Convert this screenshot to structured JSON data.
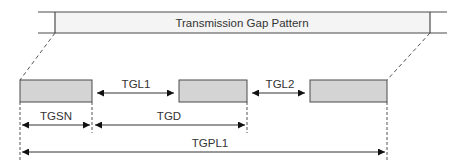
{
  "diagram": {
    "title": "Transmission Gap Pattern",
    "labels": {
      "tgl1": "TGL1",
      "tgl2": "TGL2",
      "tgsn": "TGSN",
      "tgd": "TGD",
      "tgpl1": "TGPL1"
    },
    "colors": {
      "line": "#4a4a4a",
      "band_fill": "#f4f4f4",
      "gap_fill": "#d4d4d4",
      "dashed": "#555555",
      "text": "#333333"
    }
  }
}
